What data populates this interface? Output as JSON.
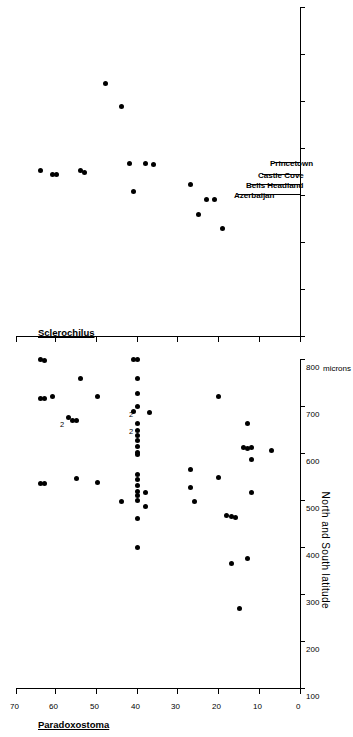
{
  "figure": {
    "panels": [
      {
        "id": "paradoxostoma",
        "title": "Paradoxostoma",
        "x_label": "microns",
        "y_label": "North and South latitude"
      },
      {
        "id": "sclerochilus",
        "title": "Sclerochilus"
      }
    ],
    "callouts": [
      {
        "label": "Azerbaijan"
      },
      {
        "label": "Bells Headland"
      },
      {
        "label": "Castle Cove"
      },
      {
        "label": "Princetown"
      }
    ],
    "multiplicity_marker": "2"
  },
  "chart_data": [
    {
      "type": "scatter",
      "id": "paradoxostoma",
      "title": "Paradoxostoma",
      "xlabel": "microns",
      "ylabel": "North and South latitude",
      "xlim": [
        100,
        810
      ],
      "ylim": [
        0,
        70
      ],
      "xticks": [
        100,
        200,
        300,
        400,
        500,
        600,
        700,
        800
      ],
      "xticklabels": [
        "100",
        "200",
        "300",
        "400",
        "500",
        "600",
        "700",
        "800"
      ],
      "yticks": [
        0,
        10,
        20,
        30,
        40,
        50,
        60,
        70
      ],
      "yticklabels": [
        "0",
        "10",
        "20",
        "30",
        "40",
        "50",
        "60",
        "70"
      ],
      "grid": false,
      "legend": null,
      "unit_annotation": "microns",
      "points": [
        {
          "x": 538,
          "y": 64
        },
        {
          "x": 538,
          "y": 63
        },
        {
          "x": 718,
          "y": 64
        },
        {
          "x": 718,
          "y": 63
        },
        {
          "x": 800,
          "y": 64
        },
        {
          "x": 798,
          "y": 63
        },
        {
          "x": 722,
          "y": 61
        },
        {
          "x": 548,
          "y": 55
        },
        {
          "x": 672,
          "y": 55
        },
        {
          "x": 672,
          "y": 56
        },
        {
          "x": 678,
          "y": 57,
          "count": 2
        },
        {
          "x": 760,
          "y": 54
        },
        {
          "x": 540,
          "y": 50
        },
        {
          "x": 722,
          "y": 50
        },
        {
          "x": 498,
          "y": 44
        },
        {
          "x": 800,
          "y": 41
        },
        {
          "x": 802,
          "y": 40
        },
        {
          "x": 760,
          "y": 40
        },
        {
          "x": 728,
          "y": 40
        },
        {
          "x": 700,
          "y": 40,
          "count": 2
        },
        {
          "x": 690,
          "y": 41
        },
        {
          "x": 664,
          "y": 40,
          "count": 2
        },
        {
          "x": 650,
          "y": 40
        },
        {
          "x": 640,
          "y": 40
        },
        {
          "x": 628,
          "y": 40
        },
        {
          "x": 616,
          "y": 40
        },
        {
          "x": 604,
          "y": 40
        },
        {
          "x": 598,
          "y": 40
        },
        {
          "x": 556,
          "y": 40
        },
        {
          "x": 546,
          "y": 40
        },
        {
          "x": 532,
          "y": 40
        },
        {
          "x": 520,
          "y": 40
        },
        {
          "x": 512,
          "y": 40
        },
        {
          "x": 500,
          "y": 40
        },
        {
          "x": 462,
          "y": 40
        },
        {
          "x": 400,
          "y": 40
        },
        {
          "x": 688,
          "y": 37
        },
        {
          "x": 518,
          "y": 38
        },
        {
          "x": 488,
          "y": 38
        },
        {
          "x": 568,
          "y": 27
        },
        {
          "x": 528,
          "y": 27
        },
        {
          "x": 498,
          "y": 26
        },
        {
          "x": 722,
          "y": 20
        },
        {
          "x": 550,
          "y": 20
        },
        {
          "x": 470,
          "y": 18
        },
        {
          "x": 466,
          "y": 17
        },
        {
          "x": 464,
          "y": 16
        },
        {
          "x": 366,
          "y": 17
        },
        {
          "x": 614,
          "y": 14
        },
        {
          "x": 664,
          "y": 13
        },
        {
          "x": 612,
          "y": 13
        },
        {
          "x": 614,
          "y": 12
        },
        {
          "x": 588,
          "y": 12
        },
        {
          "x": 518,
          "y": 12
        },
        {
          "x": 378,
          "y": 13
        },
        {
          "x": 608,
          "y": 7
        },
        {
          "x": 272,
          "y": 15
        }
      ]
    },
    {
      "type": "scatter",
      "id": "sclerochilus",
      "title": "Sclerochilus",
      "xlabel": "",
      "ylabel": "North and South latitude",
      "xlim": [
        100,
        810
      ],
      "ylim": [
        0,
        70
      ],
      "grid": false,
      "legend": null,
      "points": [
        {
          "x": 455,
          "y": 64
        },
        {
          "x": 445,
          "y": 61
        },
        {
          "x": 445,
          "y": 60
        },
        {
          "x": 455,
          "y": 54
        },
        {
          "x": 450,
          "y": 53
        },
        {
          "x": 640,
          "y": 48
        },
        {
          "x": 590,
          "y": 44
        },
        {
          "x": 470,
          "y": 42
        },
        {
          "x": 410,
          "y": 41
        },
        {
          "x": 470,
          "y": 38
        },
        {
          "x": 468,
          "y": 36
        },
        {
          "x": 425,
          "y": 27
        },
        {
          "x": 360,
          "y": 25
        },
        {
          "x": 393,
          "y": 23
        },
        {
          "x": 392,
          "y": 21
        },
        {
          "x": 330,
          "y": 19
        }
      ],
      "callouts": [
        {
          "label": "Azerbaijan",
          "y": 37
        },
        {
          "label": "Bells Headland",
          "y": 34.5
        },
        {
          "label": "Castle Cove",
          "y": 32
        },
        {
          "label": "Princetown",
          "y": 29
        }
      ]
    }
  ]
}
